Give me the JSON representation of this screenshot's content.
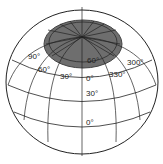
{
  "diagram": {
    "title": "",
    "colors": {
      "polar_cap_fill": "#6e6e6e",
      "polar_cap_edge": "#555555",
      "grid_lines": "#222222",
      "background": "#ffffff"
    },
    "labels": {
      "lon_90": "90°",
      "lon_60": "60°",
      "lon_30": "30°",
      "lon_0": "0°",
      "lon_330": "330°",
      "lon_300": "300°",
      "lat_60": "60°",
      "lat_30": "30°",
      "lat_0": "0°"
    }
  }
}
